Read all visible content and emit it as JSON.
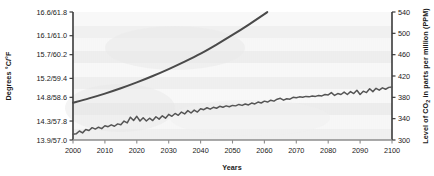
{
  "chart_data": {
    "type": "line",
    "title": "",
    "xlabel": "Years",
    "ylabel_left": "Degrees °C/°F",
    "ylabel_right": "Level of CO2 in parts per million (PPM)",
    "ylabel_right_prefix": "Level of CO",
    "ylabel_right_sub": "2",
    "ylabel_right_suffix": " in parts per million (PPM)",
    "xlim": [
      2000,
      2100
    ],
    "grid": false,
    "legend_position": "none",
    "x_ticks": [
      "2000",
      "2010",
      "2020",
      "2030",
      "2040",
      "2050",
      "2060",
      "2070",
      "2080",
      "2090",
      "2100"
    ],
    "x_tick_values": [
      2000,
      2010,
      2020,
      2030,
      2040,
      2050,
      2060,
      2070,
      2080,
      2090,
      2100
    ],
    "left_axis": {
      "label": "Degrees °C/°F",
      "tick_labels": [
        "13.9/57.0",
        "14.3/57.8",
        "14.8/58.6",
        "15.2/59.4",
        "15.7/60.2",
        "16.1/61.0",
        "16.6/61.8"
      ],
      "tick_values_c": [
        13.9,
        14.3,
        14.8,
        15.2,
        15.7,
        16.1,
        16.6
      ],
      "tick_values_f": [
        57.0,
        57.8,
        58.6,
        59.4,
        60.2,
        61.0,
        61.8
      ],
      "ylim_c": [
        13.9,
        16.6
      ]
    },
    "right_axis": {
      "label": "Level of CO2 in parts per million (PPM)",
      "tick_labels": [
        "300",
        "340",
        "380",
        "420",
        "460",
        "500",
        "540"
      ],
      "tick_values": [
        300,
        340,
        380,
        420,
        460,
        500,
        540
      ],
      "ylim": [
        300,
        540
      ]
    },
    "series": [
      {
        "name": "CO2 concentration",
        "axis": "right",
        "style": "smooth",
        "color": "#4a4a4a",
        "x": [
          2000,
          2005,
          2010,
          2015,
          2020,
          2025,
          2030,
          2035,
          2040,
          2045,
          2050,
          2055,
          2060,
          2065,
          2070
        ],
        "values": [
          370,
          378,
          387,
          397,
          408,
          420,
          433,
          447,
          462,
          479,
          497,
          516,
          536,
          558,
          580
        ]
      },
      {
        "name": "Global temperature",
        "axis": "left",
        "style": "jagged",
        "color": "#555555",
        "x": [
          2000,
          2001,
          2002,
          2003,
          2004,
          2005,
          2006,
          2007,
          2008,
          2009,
          2010,
          2011,
          2012,
          2013,
          2014,
          2015,
          2016,
          2017,
          2018,
          2019,
          2020,
          2021,
          2022,
          2023,
          2024,
          2025,
          2026,
          2027,
          2028,
          2029,
          2030,
          2031,
          2032,
          2033,
          2034,
          2035,
          2036,
          2037,
          2038,
          2039,
          2040,
          2041,
          2042,
          2043,
          2044,
          2045,
          2046,
          2047,
          2048,
          2049,
          2050,
          2051,
          2052,
          2053,
          2054,
          2055,
          2056,
          2057,
          2058,
          2059,
          2060,
          2061,
          2062,
          2063,
          2064,
          2065,
          2066,
          2067,
          2068,
          2069,
          2070,
          2071,
          2072,
          2073,
          2074,
          2075,
          2076,
          2077,
          2078,
          2079,
          2080,
          2081,
          2082,
          2083,
          2084,
          2085,
          2086,
          2087,
          2088,
          2089,
          2090,
          2091,
          2092,
          2093,
          2094,
          2095,
          2096,
          2097,
          2098,
          2099,
          2100
        ],
        "values": [
          14.02,
          14.03,
          14.09,
          14.05,
          14.12,
          14.1,
          14.16,
          14.13,
          14.17,
          14.14,
          14.2,
          14.18,
          14.22,
          14.19,
          14.24,
          14.22,
          14.3,
          14.26,
          14.38,
          14.31,
          14.4,
          14.3,
          14.37,
          14.3,
          14.36,
          14.31,
          14.39,
          14.34,
          14.41,
          14.36,
          14.44,
          14.4,
          14.46,
          14.42,
          14.49,
          14.45,
          14.52,
          14.47,
          14.53,
          14.49,
          14.56,
          14.54,
          14.58,
          14.55,
          14.59,
          14.57,
          14.61,
          14.59,
          14.62,
          14.6,
          14.63,
          14.62,
          14.65,
          14.63,
          14.66,
          14.64,
          14.68,
          14.66,
          14.7,
          14.68,
          14.72,
          14.7,
          14.74,
          14.72,
          14.76,
          14.78,
          14.74,
          14.77,
          14.76,
          14.8,
          14.79,
          14.81,
          14.8,
          14.82,
          14.81,
          14.83,
          14.82,
          14.84,
          14.83,
          14.86,
          14.85,
          14.9,
          14.84,
          14.88,
          14.86,
          14.91,
          14.86,
          14.92,
          14.88,
          14.95,
          14.86,
          14.93,
          14.9,
          14.98,
          14.92,
          14.99,
          14.95,
          15.0,
          14.97,
          15.01,
          15.02
        ]
      }
    ]
  },
  "colors": {
    "line_co2": "#3f3f3f",
    "line_temp": "#5a5a5a",
    "axis": "#3a3a3a",
    "text": "#1a1a1a",
    "band_light": "#fbfbfb",
    "band_dark": "#ededed"
  }
}
